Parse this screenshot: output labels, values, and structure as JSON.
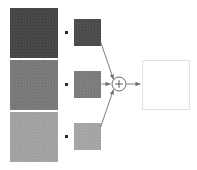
{
  "diagram": {
    "type": "block-diagram",
    "canvas": {
      "width": 197,
      "height": 170,
      "background": "#ffffff"
    },
    "operator_symbols": {
      "multiply": "·",
      "sum": "+"
    },
    "branches": [
      {
        "index": 0,
        "weight_patch": {
          "name": "weight-patch-1",
          "color": "#414141",
          "shade": "dark-gray",
          "width": 48,
          "height": 50
        },
        "multiply_dot": {
          "name": "multiply-dot-1",
          "symbol": "·",
          "color": "#2b2b2b"
        },
        "input_patch": {
          "name": "input-patch-1",
          "color": "#474747",
          "shade": "dark-gray",
          "width": 27,
          "height": 27
        },
        "connector": {
          "name": "connector-1",
          "kind": "diagonal-arrow",
          "direction": "down-right"
        }
      },
      {
        "index": 1,
        "weight_patch": {
          "name": "weight-patch-2",
          "color": "#777777",
          "shade": "medium-gray",
          "width": 48,
          "height": 50
        },
        "multiply_dot": {
          "name": "multiply-dot-2",
          "symbol": "·",
          "color": "#2b2b2b"
        },
        "input_patch": {
          "name": "input-patch-2",
          "color": "#7b7b7b",
          "shade": "medium-gray",
          "width": 27,
          "height": 27
        },
        "connector": {
          "name": "connector-2",
          "kind": "horizontal-arrow",
          "direction": "right"
        }
      },
      {
        "index": 2,
        "weight_patch": {
          "name": "weight-patch-3",
          "color": "#a3a3a3",
          "shade": "light-gray",
          "width": 48,
          "height": 50
        },
        "multiply_dot": {
          "name": "multiply-dot-3",
          "symbol": "·",
          "color": "#2b2b2b"
        },
        "input_patch": {
          "name": "input-patch-3",
          "color": "#a6a6a6",
          "shade": "light-gray",
          "width": 27,
          "height": 27
        },
        "connector": {
          "name": "connector-3",
          "kind": "diagonal-arrow",
          "direction": "up-right"
        }
      }
    ],
    "sum_node": {
      "name": "sum-node",
      "symbol": "+",
      "shape": "circle",
      "radius": 7,
      "center": {
        "x": 119,
        "y": 84
      },
      "stroke": "#5a5a5a",
      "fill": "#ffffff"
    },
    "output": {
      "name": "output-patch",
      "label": "",
      "color": "#ffffff",
      "border_color": "#e2e2e2",
      "width": 48,
      "height": 50,
      "arrow": {
        "name": "output-arrow",
        "kind": "horizontal-arrow",
        "direction": "right"
      }
    },
    "line_color": "#6e6e6e"
  }
}
